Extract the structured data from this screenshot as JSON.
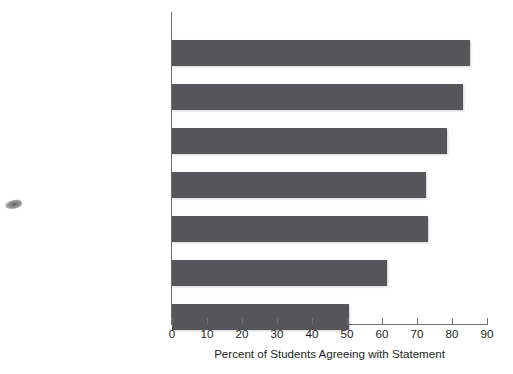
{
  "chart_data": {
    "type": "bar",
    "orientation": "horizontal",
    "title": "",
    "xlabel": "Percent of Students Agreeing with Statement",
    "ylabel": "",
    "xlim": [
      0,
      90
    ],
    "xticks": [
      0,
      10,
      20,
      30,
      40,
      50,
      60,
      70,
      80,
      90
    ],
    "grid": false,
    "legend": false,
    "bar_color": "#56565a",
    "axis_color": "#6d6e71",
    "categories": [
      "To be able to get\na better job",
      "To learn more about\nthings that interest me",
      "To get training for\na specific career",
      "To be able to make\nmore money",
      "To gain a general education\nand appreciation of ideas",
      "To prepare myself\nfor graduate or\nprofessional school",
      "To make me a more\ncultured person"
    ],
    "values": [
      85,
      83,
      78.5,
      72.5,
      73,
      61.5,
      50.5
    ]
  },
  "artifacts": {
    "smudge_label": "scan-smudge"
  }
}
